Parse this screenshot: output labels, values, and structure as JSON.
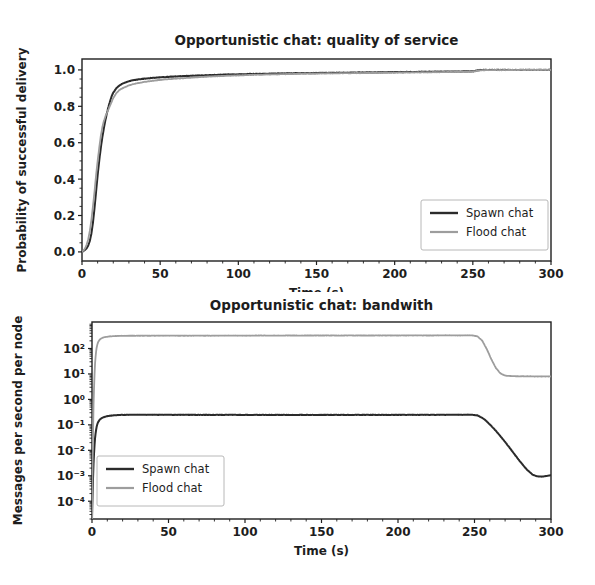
{
  "figure": {
    "width": 595,
    "height": 585,
    "background": "#ffffff"
  },
  "colors": {
    "spawn": "#2b2b2b",
    "flood": "#9d9d9d",
    "axis": "#1f1f1f",
    "text": "#1d1d1d",
    "legend_border": "#b8b8b8"
  },
  "chart_data": [
    {
      "id": "quality-of-service",
      "type": "line",
      "title": "Opportunistic chat: quality of service",
      "xlabel": "Time (s)",
      "ylabel": "Probability of successful delivery",
      "xscale": "linear",
      "yscale": "linear",
      "xlim": [
        0,
        300
      ],
      "ylim": [
        -0.05,
        1.06
      ],
      "xticks": [
        0,
        50,
        100,
        150,
        200,
        250,
        300
      ],
      "xticklabels": [
        "0",
        "50",
        "100",
        "150",
        "200",
        "250",
        "300"
      ],
      "yticks": [
        0.0,
        0.2,
        0.4,
        0.6,
        0.8,
        1.0
      ],
      "yticklabels": [
        "0.0",
        "0.2",
        "0.4",
        "0.6",
        "0.8",
        "1.0"
      ],
      "grid": false,
      "legend_position": "lower right",
      "series": [
        {
          "name": "Spawn chat",
          "color": "#2b2b2b",
          "width": 2.0,
          "x": [
            0,
            1,
            2,
            3,
            4,
            5,
            6,
            7,
            8,
            9,
            10,
            11,
            12,
            13,
            14,
            15,
            16,
            17,
            18,
            19,
            20,
            22,
            24,
            26,
            28,
            30,
            33,
            36,
            40,
            45,
            50,
            55,
            60,
            65,
            70,
            80,
            90,
            100,
            110,
            120,
            130,
            140,
            150,
            160,
            170,
            180,
            190,
            200,
            210,
            220,
            230,
            240,
            250,
            252,
            254,
            256,
            260,
            270,
            280,
            290,
            300
          ],
          "y": [
            0.0,
            0.005,
            0.012,
            0.02,
            0.035,
            0.06,
            0.1,
            0.16,
            0.24,
            0.33,
            0.42,
            0.5,
            0.57,
            0.63,
            0.68,
            0.725,
            0.765,
            0.8,
            0.83,
            0.855,
            0.875,
            0.9,
            0.915,
            0.925,
            0.932,
            0.938,
            0.944,
            0.948,
            0.952,
            0.956,
            0.959,
            0.962,
            0.964,
            0.966,
            0.968,
            0.971,
            0.974,
            0.976,
            0.978,
            0.979,
            0.981,
            0.982,
            0.983,
            0.984,
            0.985,
            0.986,
            0.987,
            0.988,
            0.989,
            0.99,
            0.991,
            0.991,
            0.992,
            0.996,
            0.999,
            1.0,
            1.0,
            1.0,
            1.0,
            1.0,
            1.0
          ]
        },
        {
          "name": "Flood chat",
          "color": "#9d9d9d",
          "width": 1.8,
          "x": [
            0,
            1,
            2,
            3,
            4,
            5,
            6,
            7,
            8,
            9,
            10,
            11,
            12,
            13,
            14,
            15,
            16,
            17,
            18,
            19,
            20,
            22,
            24,
            26,
            28,
            30,
            33,
            36,
            40,
            45,
            50,
            55,
            60,
            65,
            70,
            80,
            90,
            100,
            110,
            120,
            130,
            140,
            150,
            160,
            170,
            180,
            190,
            200,
            210,
            220,
            230,
            240,
            250,
            252,
            254,
            256,
            260,
            270,
            280,
            290,
            300
          ],
          "y": [
            0.0,
            0.008,
            0.02,
            0.04,
            0.07,
            0.115,
            0.175,
            0.25,
            0.33,
            0.42,
            0.5,
            0.57,
            0.635,
            0.685,
            0.72,
            0.745,
            0.765,
            0.785,
            0.805,
            0.825,
            0.845,
            0.873,
            0.89,
            0.9,
            0.908,
            0.915,
            0.922,
            0.928,
            0.934,
            0.94,
            0.945,
            0.949,
            0.952,
            0.955,
            0.958,
            0.963,
            0.967,
            0.97,
            0.973,
            0.975,
            0.977,
            0.979,
            0.98,
            0.981,
            0.982,
            0.983,
            0.984,
            0.985,
            0.986,
            0.987,
            0.988,
            0.989,
            0.99,
            0.994,
            0.997,
            0.998,
            0.999,
            0.999,
            1.0,
            1.0,
            1.0
          ]
        }
      ]
    },
    {
      "id": "bandwith",
      "type": "line",
      "title": "Opportunistic chat: bandwith",
      "xlabel": "Time (s)",
      "ylabel": "Messages per second per node",
      "xscale": "linear",
      "yscale": "log",
      "xlim": [
        0,
        300
      ],
      "ylim": [
        2e-05,
        1100
      ],
      "xticks": [
        0,
        50,
        100,
        150,
        200,
        250,
        300
      ],
      "xticklabels": [
        "0",
        "50",
        "100",
        "150",
        "200",
        "250",
        "300"
      ],
      "yticks": [
        100,
        10,
        1,
        0.1,
        0.01,
        0.001,
        0.0001
      ],
      "yticklabels": [
        "10²",
        "10¹",
        "10⁰",
        "10⁻¹",
        "10⁻²",
        "10⁻³",
        "10⁻⁴"
      ],
      "grid": false,
      "legend_position": "lower left",
      "series": [
        {
          "name": "Spawn chat",
          "color": "#2b2b2b",
          "width": 2.0,
          "x": [
            0,
            0.5,
            1,
            1.5,
            2,
            2.5,
            3,
            3.5,
            4,
            5,
            6,
            7,
            8,
            9,
            10,
            12,
            14,
            16,
            18,
            20,
            25,
            30,
            40,
            50,
            60,
            70,
            80,
            90,
            100,
            110,
            120,
            130,
            140,
            150,
            160,
            170,
            180,
            190,
            200,
            210,
            220,
            230,
            240,
            248,
            252,
            256,
            260,
            264,
            268,
            272,
            276,
            280,
            284,
            288,
            291,
            294,
            297,
            300
          ],
          "y": [
            2e-05,
            0.0004,
            0.003,
            0.012,
            0.03,
            0.055,
            0.082,
            0.108,
            0.128,
            0.158,
            0.178,
            0.192,
            0.203,
            0.212,
            0.219,
            0.229,
            0.236,
            0.241,
            0.244,
            0.246,
            0.249,
            0.25,
            0.249,
            0.248,
            0.248,
            0.247,
            0.247,
            0.247,
            0.246,
            0.246,
            0.246,
            0.245,
            0.246,
            0.246,
            0.246,
            0.246,
            0.247,
            0.247,
            0.247,
            0.248,
            0.248,
            0.249,
            0.249,
            0.25,
            0.235,
            0.175,
            0.105,
            0.058,
            0.03,
            0.015,
            0.0072,
            0.0035,
            0.0018,
            0.0011,
            0.00095,
            0.00092,
            0.00098,
            0.00105
          ]
        },
        {
          "name": "Flood chat",
          "color": "#9d9d9d",
          "width": 1.8,
          "x": [
            0,
            0.5,
            1,
            1.5,
            2,
            2.5,
            3,
            3.5,
            4,
            5,
            6,
            7,
            8,
            9,
            10,
            12,
            14,
            16,
            18,
            20,
            25,
            30,
            40,
            50,
            60,
            70,
            80,
            90,
            100,
            110,
            120,
            130,
            140,
            150,
            160,
            170,
            180,
            190,
            200,
            210,
            220,
            230,
            240,
            248,
            252,
            255,
            258,
            261,
            264,
            267,
            270,
            275,
            280,
            285,
            290,
            295,
            300
          ],
          "y": [
            2e-05,
            0.012,
            0.6,
            6,
            26,
            62,
            105,
            145,
            178,
            222,
            248,
            265,
            277,
            285,
            292,
            300,
            306,
            310,
            312,
            314,
            317,
            318,
            319,
            320,
            318,
            321,
            319,
            322,
            320,
            323,
            321,
            324,
            322,
            325,
            323,
            326,
            324,
            327,
            325,
            328,
            326,
            329,
            327,
            330,
            300,
            205,
            95,
            38,
            17,
            10.5,
            8.6,
            8.2,
            8.1,
            8.1,
            8.0,
            8.0,
            8.0
          ]
        }
      ]
    }
  ]
}
